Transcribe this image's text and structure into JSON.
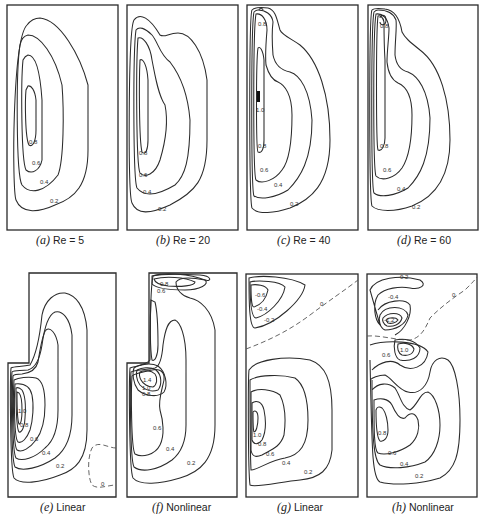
{
  "figure": {
    "panels": [
      {
        "id": "a",
        "letter": "(a)",
        "caption": "Re = 5",
        "contour_labels": [
          "0.8",
          "0.6",
          "0.4",
          "0.2"
        ]
      },
      {
        "id": "b",
        "letter": "(b)",
        "caption": "Re = 20",
        "contour_labels": [
          "0.8",
          "0.6",
          "0.4",
          "0.2"
        ]
      },
      {
        "id": "c",
        "letter": "(c)",
        "caption": "Re = 40",
        "contour_labels": [
          "0.8",
          "1.0",
          "0.8",
          "0.6",
          "0.4",
          "0.2"
        ]
      },
      {
        "id": "d",
        "letter": "(d)",
        "caption": "Re = 60",
        "contour_labels": [
          "0.8",
          "0.8",
          "0.6",
          "0.4",
          "0.2"
        ]
      },
      {
        "id": "e",
        "letter": "(e)",
        "caption": "Linear",
        "contour_labels": [
          "1.0",
          "0.8",
          "0.6",
          "0.4",
          "0.2",
          "0"
        ]
      },
      {
        "id": "f",
        "letter": "(f)",
        "caption": "Nonlinear",
        "contour_labels": [
          "0.8",
          "0.6",
          "1.4",
          "1.0",
          "0.8",
          "0.6",
          "0.4",
          "0.2"
        ]
      },
      {
        "id": "g",
        "letter": "(g)",
        "caption": "Linear",
        "contour_labels": [
          "-0.6",
          "-0.4",
          "-0.2",
          "0",
          "1.0",
          "0.8",
          "0.6",
          "0.4",
          "0.2"
        ]
      },
      {
        "id": "h",
        "letter": "(h)",
        "caption": "Nonlinear",
        "contour_labels": [
          "-0.2",
          "-0.4",
          "-1.2",
          "0",
          "1.0",
          "0.6",
          "0.8",
          "0.6",
          "0.4",
          "0.2"
        ]
      }
    ]
  }
}
